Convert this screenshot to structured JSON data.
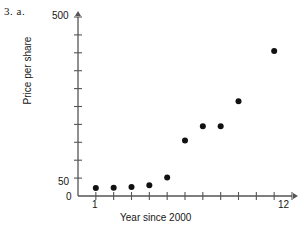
{
  "problem": {
    "label": "3.  a."
  },
  "chart_data": {
    "type": "scatter",
    "title": "",
    "xlabel": "Year since 2000",
    "ylabel": "Price per share",
    "x": [
      1,
      2,
      3,
      4,
      5,
      6,
      7,
      8,
      9,
      11
    ],
    "y": [
      22,
      23,
      25,
      30,
      52,
      155,
      195,
      195,
      265,
      405
    ],
    "xlim": [
      0,
      12
    ],
    "ylim": [
      0,
      500
    ],
    "x_ticks": [
      1,
      2,
      3,
      4,
      5,
      6,
      7,
      8,
      9,
      10,
      11,
      12
    ],
    "x_tick_labels": [
      "1",
      "",
      "",
      "",
      "",
      "",
      "",
      "",
      "",
      "",
      "",
      "12"
    ],
    "y_ticks": [
      0,
      50,
      100,
      150,
      200,
      250,
      300,
      350,
      400,
      450,
      500
    ],
    "y_tick_labels": [
      "0",
      "50",
      "",
      "",
      "",
      "",
      "",
      "",
      "",
      "",
      "500"
    ],
    "grid": false,
    "legend": null,
    "marker": "filled-circle",
    "marker_color": "#111111",
    "axis_color": "#555555"
  }
}
